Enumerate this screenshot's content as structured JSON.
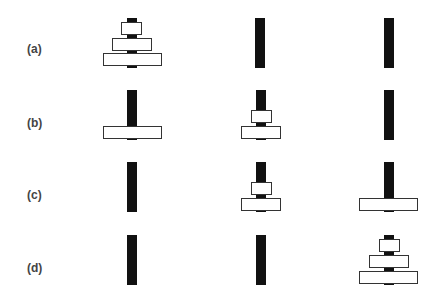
{
  "figure": {
    "rows": [
      {
        "label": "(a)",
        "pegs": [
          [
            "large",
            "medium",
            "small"
          ],
          [],
          []
        ]
      },
      {
        "label": "(b)",
        "pegs": [
          [
            "large"
          ],
          [
            "medium",
            "small"
          ],
          []
        ]
      },
      {
        "label": "(c)",
        "pegs": [
          [],
          [
            "medium",
            "small"
          ],
          [
            "large"
          ]
        ]
      },
      {
        "label": "(d)",
        "pegs": [
          [],
          [],
          [
            "large",
            "medium",
            "small"
          ]
        ]
      }
    ],
    "colors": {
      "pole": "#111111",
      "disk_fill": "#ffffff",
      "disk_border": "#333333",
      "label": "#444444"
    }
  }
}
